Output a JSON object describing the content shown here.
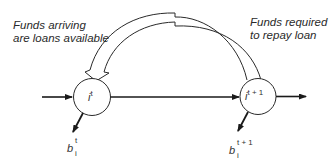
{
  "diagram": {
    "annotations": {
      "left_line1": "Funds arriving",
      "left_line2": "are loans available",
      "right_line1": "Funds required",
      "right_line2": "to repay loan"
    },
    "nodes": [
      {
        "id": "node-t",
        "base": "i",
        "superscript": "t"
      },
      {
        "id": "node-t1",
        "base": "i",
        "superscript": "t + 1"
      }
    ],
    "outflows": [
      {
        "id": "b-t",
        "base": "b",
        "superscript": "t",
        "subscript": "i"
      },
      {
        "id": "b-t1",
        "base": "b",
        "superscript": "t + 1",
        "subscript": "i"
      }
    ],
    "edges": [
      {
        "from": "external",
        "to": "node-t",
        "style": "solid-arrow"
      },
      {
        "from": "node-t",
        "to": "node-t1",
        "style": "solid-arrow"
      },
      {
        "from": "node-t1",
        "to": "external",
        "style": "solid-arrow"
      },
      {
        "from": "node-t1",
        "to": "node-t",
        "style": "hollow-curved-arrow"
      },
      {
        "from": "node-t",
        "to": "b-t",
        "style": "solid-arrow"
      },
      {
        "from": "node-t1",
        "to": "b-t1",
        "style": "solid-arrow"
      }
    ],
    "colors": {
      "stroke": "#1a1a1a",
      "background": "#ffffff"
    }
  }
}
